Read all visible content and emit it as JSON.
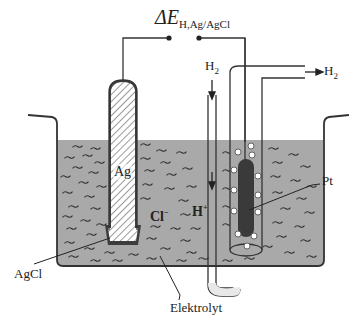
{
  "diagram": {
    "title_symbol": "ΔE",
    "title_subscript": "H,Ag/AgCl",
    "labels": {
      "h2_in": "H",
      "h2_in_sub": "2",
      "h2_out": "H",
      "h2_out_sub": "2",
      "silver": "Ag",
      "platinum": "Pt",
      "silver_chloride": "AgCl",
      "chloride_ion": "Cl",
      "chloride_charge": "−",
      "hydrogen_ion": "H",
      "hydrogen_charge": "+",
      "electrolyte": "Elektrolyt"
    },
    "colors": {
      "electrolyte": "#a9a9a9",
      "outline": "#333333",
      "platinum": "#3a3a3a",
      "agcl": "#3d3d3d",
      "hatch": "#555555",
      "background": "#ffffff"
    }
  }
}
